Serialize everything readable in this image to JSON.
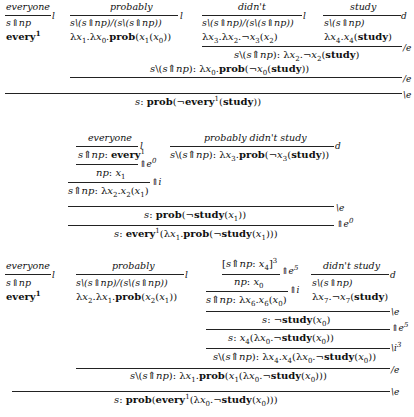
{
  "derivation1": {
    "lexicon": [
      {
        "word": "everyone",
        "rule": "l",
        "type": "s⇑np",
        "term": "every¹"
      },
      {
        "word": "probably",
        "rule": "l",
        "type": "s\\(s⇑np)/(s\\(s⇑np))",
        "term": "λx₁.λx₀.prob(x₁(x₀))"
      },
      {
        "word": "didn't",
        "rule": "l",
        "type": "s\\(s⇑np)/(s\\(s⇑np))",
        "term": "λx₃.λx₂.¬x₃(x₂)"
      },
      {
        "word": "study",
        "rule": "d",
        "type": "s\\(s⇑np)",
        "term": "λx₄.x₄(study)"
      }
    ],
    "steps": [
      {
        "rule": "/e",
        "result": "s\\(s⇑np): λx₂.¬x₂(study)"
      },
      {
        "rule": "/e",
        "result": "s\\(s⇑np): λx₀.prob(¬x₀(study))"
      },
      {
        "rule": "\\e",
        "result": "s: prob(¬every¹(study))"
      }
    ]
  },
  "derivation2": {
    "lexicon": [
      {
        "word": "everyone",
        "rule": "l",
        "result": "s⇑np: every¹"
      },
      {
        "word": "probably didn't study",
        "rule": "d",
        "result": "s\\(s⇑np): λx₃.prob(¬x₃(study))"
      }
    ],
    "steps": [
      {
        "rule": "⇑e⁰",
        "result": "np: x₁"
      },
      {
        "rule": "⇑i",
        "result": "s⇑np: λx₂.x₂(x₁)"
      },
      {
        "rule": "\\e",
        "result": "s: prob(¬study(x₁))"
      },
      {
        "rule": "⇑e⁰",
        "result": "s: every¹(λx₁.prob(¬study(x₁)))"
      }
    ]
  },
  "derivation3": {
    "lexicon": [
      {
        "word": "everyone",
        "rule": "l",
        "type": "s⇑np",
        "term": "every¹"
      },
      {
        "word": "probably",
        "rule": "l",
        "type": "s\\(s⇑np)/(s\\(s⇑np))",
        "term": "λx₂.λx₁.prob(x₂(x₁))"
      },
      {
        "word": "[s⇑np: x₄]³",
        "rule": "⇑e⁵",
        "result": "np: x₀"
      },
      {
        "word": "didn't study",
        "rule": "d",
        "type": "s\\(s⇑np)",
        "term": "λx₇.¬x₇(study)"
      }
    ],
    "steps": [
      {
        "rule": "⇑i",
        "result": "s⇑np: λx₆.x₆(x₀)"
      },
      {
        "rule": "\\e",
        "result": "s: ¬study(x₀)"
      },
      {
        "rule": "⇑e⁵",
        "result": "s: x₄(λx₀.¬study(x₀))"
      },
      {
        "rule": "\\i³",
        "result": "s\\(s⇑np): λx₄.x₄(λx₀.¬study(x₀))"
      },
      {
        "rule": "/e",
        "result": "s\\(s⇑np): λx₁.prob(x₁(λx₀.¬study(x₀)))"
      },
      {
        "rule": "\\e",
        "result": "s: prob(every¹(λx₀.¬study(x₀)))"
      }
    ]
  }
}
